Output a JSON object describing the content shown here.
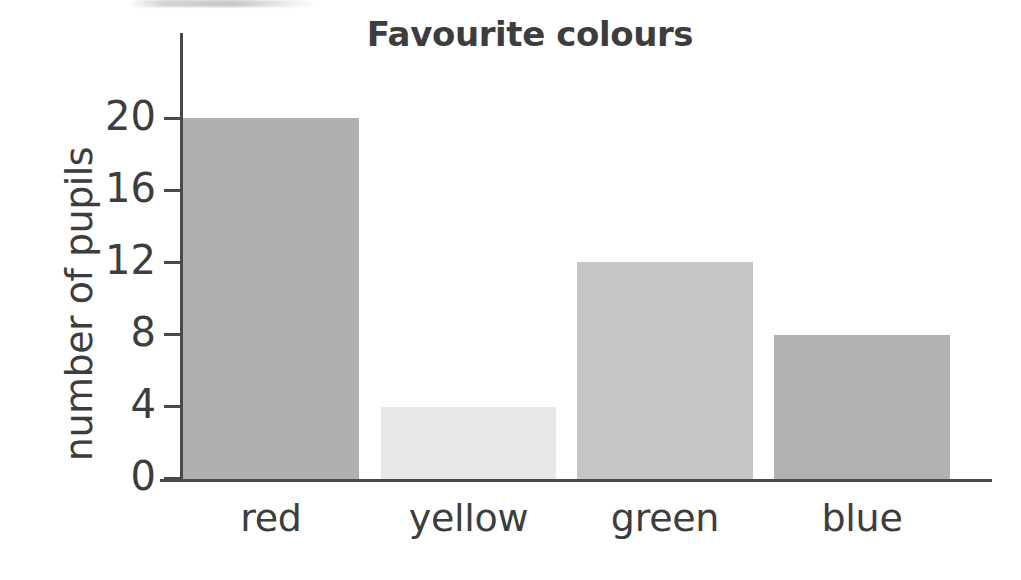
{
  "chart_data": {
    "type": "bar",
    "title": "Favourite colours",
    "xlabel": "",
    "ylabel": "number of pupils",
    "categories": [
      "red",
      "yellow",
      "green",
      "blue"
    ],
    "values": [
      20,
      4,
      12,
      8
    ],
    "ylim": [
      0,
      22
    ],
    "yticks": [
      0,
      4,
      8,
      12,
      16,
      20
    ],
    "ytick_labels": [
      "0",
      "4",
      "8",
      "12",
      "16",
      "20"
    ],
    "grid": false,
    "legend": "none",
    "bar_colors": [
      "#b0b0b0",
      "#e7e7e7",
      "#c6c6c6",
      "#b2b2b2"
    ],
    "axis_color": "#4a4a4a",
    "text_color": "#3d3d3d",
    "background": "#ffffff",
    "bars": [
      {
        "category": "red",
        "value": 20,
        "color": "#b0b0b0",
        "left": 183,
        "width": 176
      },
      {
        "category": "yellow",
        "value": 4,
        "color": "#e7e7e7",
        "left": 381,
        "width": 175
      },
      {
        "category": "green",
        "value": 12,
        "color": "#c6c6c6",
        "left": 577,
        "width": 176
      },
      {
        "category": "blue",
        "value": 8,
        "color": "#b2b2b2",
        "left": 774,
        "width": 176
      }
    ]
  },
  "axis": {
    "y_title": "number of pupils",
    "ticks": [
      {
        "label": "20",
        "value": 20,
        "y": 118
      },
      {
        "label": "16",
        "value": 16,
        "y": 190
      },
      {
        "label": "12",
        "value": 12,
        "y": 262
      },
      {
        "label": "8",
        "value": 8,
        "y": 334
      },
      {
        "label": "4",
        "value": 4,
        "y": 406
      },
      {
        "label": "0",
        "value": 0,
        "y": 478
      }
    ]
  }
}
